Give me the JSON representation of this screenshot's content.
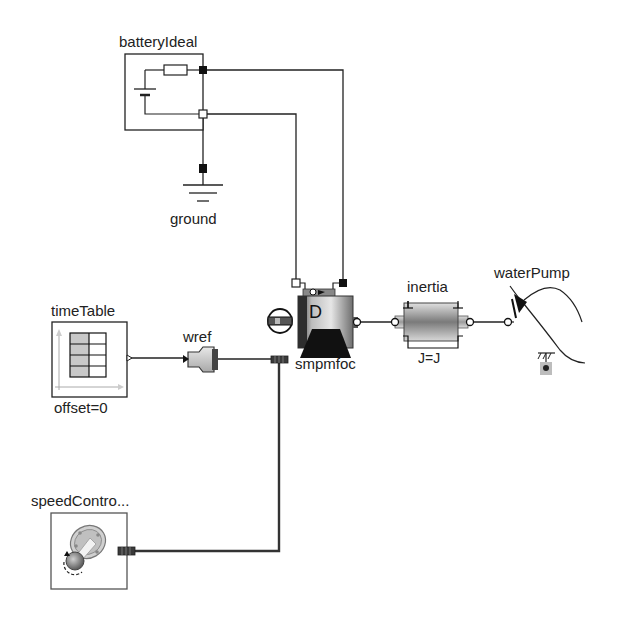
{
  "diagram": {
    "background": "#ffffff",
    "wire_color": "#222222",
    "bus_wire_color": "#333333"
  },
  "components": {
    "batteryIdeal": {
      "label": "batteryIdeal"
    },
    "ground": {
      "label": "ground"
    },
    "timeTable": {
      "label": "timeTable",
      "param": "offset=0"
    },
    "wref": {
      "label": "wref"
    },
    "smpmfoc": {
      "label": "smpmfoc",
      "icon_letter": "D"
    },
    "inertia": {
      "label": "inertia",
      "param": "J=J"
    },
    "waterPump": {
      "label": "waterPump"
    },
    "speedController": {
      "label": "speedContro..."
    }
  },
  "connections": [
    {
      "from": "batteryIdeal.p",
      "to": "smpmfoc.pin_p"
    },
    {
      "from": "batteryIdeal.n",
      "to": "smpmfoc.pin_n"
    },
    {
      "from": "batteryIdeal.n",
      "to": "ground.p"
    },
    {
      "from": "timeTable.y",
      "to": "wref.u"
    },
    {
      "from": "wref.y",
      "to": "smpmfoc.bus"
    },
    {
      "from": "speedController.bus",
      "to": "smpmfoc.bus"
    },
    {
      "from": "smpmfoc.flange",
      "to": "inertia.flange_a"
    },
    {
      "from": "inertia.flange_b",
      "to": "waterPump.flange"
    }
  ]
}
